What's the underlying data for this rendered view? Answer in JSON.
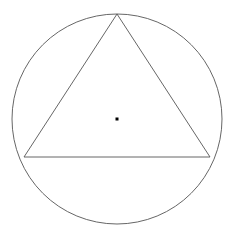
{
  "canvas": {
    "width": 235,
    "height": 240,
    "background_color": "#ffffff"
  },
  "figure": {
    "name": "circle-with-inscribed-triangle",
    "stroke_color": "#555555",
    "stroke_width": 0.9,
    "point_color": "#000000"
  },
  "chart_data": {
    "type": "diagram",
    "title": "",
    "subtitle": "",
    "xlabel": "",
    "ylabel": "",
    "grid": false,
    "legend": null,
    "annotations": [],
    "tick_labels": [],
    "shapes": [
      {
        "id": "circumcircle",
        "type": "circle",
        "center": [
          117,
          119
        ],
        "radius": 105,
        "bounds": {
          "x_min": 12,
          "x_max": 222,
          "y_min": 14,
          "y_max": 224
        },
        "stroke": "#555555",
        "stroke_width": 0.9,
        "fill": "none"
      },
      {
        "id": "inscribed-triangle",
        "type": "polygon",
        "vertices": [
          [
            117,
            14
          ],
          [
            210,
            157
          ],
          [
            24,
            157
          ]
        ],
        "stroke": "#555555",
        "stroke_width": 0.9,
        "fill": "none"
      },
      {
        "id": "center-point",
        "type": "point",
        "position": [
          117,
          119
        ],
        "size": 3,
        "fill": "#000000"
      }
    ]
  }
}
